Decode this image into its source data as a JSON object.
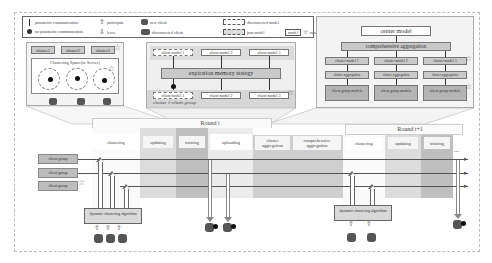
{
  "legend": {
    "items": [
      {
        "icon": "arrow-up-thin-icon",
        "label": "parametric communication"
      },
      {
        "icon": "disconnect-arrow-icon",
        "label": "no parametric communication"
      },
      {
        "icon": "hollow-up-arrow-icon",
        "label": "participate"
      },
      {
        "icon": "hollow-down-arrow-icon",
        "label": "leave"
      },
      {
        "icon": "new-client-icon",
        "label": "new client"
      },
      {
        "icon": "disconnected-client-icon",
        "label": "disconnected client"
      },
      {
        "icon": "dashed-box-icon",
        "label": "disconnected model"
      },
      {
        "icon": "dashed-gray-box-icon",
        "label": "past model"
      },
      {
        "icon": "star-box-icon",
        "box_label": "model",
        "label": "new model"
      }
    ]
  },
  "clustering_panel": {
    "clusters": [
      "cluster1",
      "cluster2",
      "cluster3"
    ],
    "title": "Clustering Space(in Server)"
  },
  "memory_panel": {
    "top_models": [
      "client model 1",
      "client model 2",
      "client model 3"
    ],
    "strategy": "expiration memory stategy",
    "bottom_models": [
      "client model 1",
      "client model 2",
      "client model 3"
    ],
    "group_label": "cluster 1-client group"
  },
  "aggregation_panel": {
    "center": "center model",
    "comprehensive": "comprehensive aggregation",
    "cluster_models": [
      "cluster model 1",
      "cluster model 2",
      "cluster model 3"
    ],
    "cluster_aggs": [
      "cluster aggregation",
      "cluster aggregation",
      "cluster aggregation"
    ],
    "group_models": [
      "client group models",
      "client group models",
      "client group models"
    ]
  },
  "timeline": {
    "round_t": "Round t",
    "round_t1": "Round t+1",
    "phases_t": [
      "clustering",
      "updating",
      "training",
      "uploading",
      "cluster aggregation",
      "comprehensive aggregation"
    ],
    "phases_t1": [
      "clustering",
      "updating",
      "training"
    ],
    "ellipsis": "...",
    "client_groups": [
      "client group",
      "client group",
      "client group"
    ],
    "algo_left": "dynamic clustering algorithm",
    "algo_right": "dynamic clustering algorithm"
  }
}
